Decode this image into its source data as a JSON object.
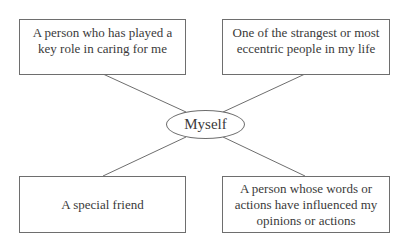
{
  "diagram": {
    "type": "mind-map",
    "center": {
      "label": "Myself"
    },
    "nodes": [
      {
        "id": "top-left",
        "label": "A person who has played a\nkey role in caring for me"
      },
      {
        "id": "top-right",
        "label": "One of the strangest or most\neccentric people in my life"
      },
      {
        "id": "bottom-left",
        "label": "A special friend"
      },
      {
        "id": "bottom-right",
        "label": "A person whose words or\nactions have influenced my\nopinions or actions"
      }
    ],
    "colors": {
      "line": "#6e6e6e",
      "text": "#3a3a3a",
      "background": "#ffffff"
    }
  }
}
